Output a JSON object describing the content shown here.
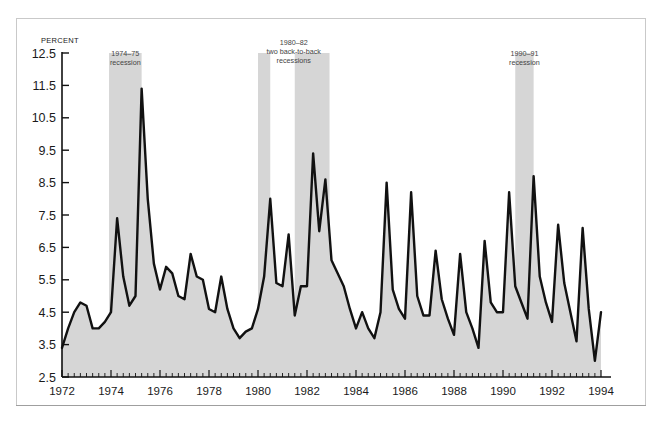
{
  "figure": {
    "y_axis_title": "PERCENT"
  },
  "annotations": [
    {
      "id": "rec1",
      "lines": [
        "1974–75",
        "recession"
      ]
    },
    {
      "id": "rec2",
      "lines": [
        "1980–82",
        "two back-to-back",
        "recessions"
      ]
    },
    {
      "id": "rec3",
      "lines": [
        "1990–91",
        "recession"
      ]
    }
  ],
  "colors": {
    "line": "#111111",
    "band": "#d6d6d6",
    "area": "#d6d6d6",
    "frame": "#c9c9c9",
    "text": "#1a1a1a"
  },
  "chart_data": {
    "type": "line",
    "title": "",
    "xlabel": "",
    "ylabel": "PERCENT",
    "xlim": [
      1972.0,
      1994.0
    ],
    "ylim": [
      2.5,
      12.5
    ],
    "grid": false,
    "legend": "none",
    "y_ticks": [
      2.5,
      3.5,
      4.5,
      5.5,
      6.5,
      7.5,
      8.5,
      9.5,
      10.5,
      11.5,
      12.5
    ],
    "y_tick_labels": [
      "2.5",
      "3.5",
      "4.5",
      "5.5",
      "6.5",
      "7.5",
      "8.5",
      "9.5",
      "10.5",
      "11.5",
      "12.5"
    ],
    "x_ticks": [
      1972,
      1974,
      1976,
      1978,
      1980,
      1982,
      1984,
      1986,
      1988,
      1990,
      1992,
      1994
    ],
    "x_tick_labels": [
      "1972",
      "1974",
      "1976",
      "1978",
      "1980",
      "1982",
      "1984",
      "1986",
      "1988",
      "1990",
      "1992",
      "1994"
    ],
    "x_minor_tick_interval": 0.25,
    "series": [
      {
        "name": "percent",
        "x": [
          1972.0,
          1972.25,
          1972.5,
          1972.75,
          1973.0,
          1973.25,
          1973.5,
          1973.75,
          1974.0,
          1974.25,
          1974.5,
          1974.75,
          1975.0,
          1975.25,
          1975.5,
          1975.75,
          1976.0,
          1976.25,
          1976.5,
          1976.75,
          1977.0,
          1977.25,
          1977.5,
          1977.75,
          1978.0,
          1978.25,
          1978.5,
          1978.75,
          1979.0,
          1979.25,
          1979.5,
          1979.75,
          1980.0,
          1980.25,
          1980.5,
          1980.75,
          1981.0,
          1981.25,
          1981.5,
          1981.75,
          1982.0,
          1982.25,
          1982.5,
          1982.75,
          1983.0,
          1983.25,
          1983.5,
          1983.75,
          1984.0,
          1984.25,
          1984.5,
          1984.75,
          1985.0,
          1985.25,
          1985.5,
          1985.75,
          1986.0,
          1986.25,
          1986.5,
          1986.75,
          1987.0,
          1987.25,
          1987.5,
          1987.75,
          1988.0,
          1988.25,
          1988.5,
          1988.75,
          1989.0,
          1989.25,
          1989.5,
          1989.75,
          1990.0,
          1990.25,
          1990.5,
          1990.75,
          1991.0,
          1991.25,
          1991.5,
          1991.75,
          1992.0,
          1992.25,
          1992.5,
          1992.75,
          1993.0,
          1993.25,
          1993.5,
          1993.75,
          1994.0
        ],
        "values": [
          3.4,
          4.0,
          4.5,
          4.8,
          4.7,
          4.0,
          4.0,
          4.2,
          4.5,
          7.4,
          5.6,
          4.7,
          5.0,
          11.4,
          8.0,
          6.0,
          5.2,
          5.9,
          5.7,
          5.0,
          4.9,
          6.3,
          5.6,
          5.5,
          4.6,
          4.5,
          5.6,
          4.6,
          4.0,
          3.7,
          3.9,
          4.0,
          4.6,
          5.6,
          8.0,
          5.4,
          5.3,
          6.9,
          4.4,
          5.3,
          5.3,
          9.4,
          7.0,
          8.6,
          6.1,
          5.7,
          5.3,
          4.6,
          4.0,
          4.5,
          4.0,
          3.7,
          4.5,
          8.5,
          5.2,
          4.6,
          4.3,
          8.2,
          5.0,
          4.4,
          4.4,
          6.4,
          4.9,
          4.3,
          3.8,
          6.3,
          4.5,
          4.0,
          3.4,
          6.7,
          4.8,
          4.5,
          4.5,
          8.2,
          5.3,
          4.8,
          4.3,
          8.7,
          5.6,
          4.8,
          4.2,
          7.2,
          5.4,
          4.5,
          3.6,
          7.1,
          4.6,
          3.0,
          4.5
        ]
      }
    ],
    "recession_bands": [
      {
        "label": "1974–75 recession",
        "start": 1973.92,
        "end": 1975.25
      },
      {
        "label": "1980 recession",
        "start": 1980.0,
        "end": 1980.5
      },
      {
        "label": "1981–82 recession",
        "start": 1981.5,
        "end": 1982.92
      },
      {
        "label": "1990–91 recession",
        "start": 1990.5,
        "end": 1991.25
      }
    ]
  }
}
